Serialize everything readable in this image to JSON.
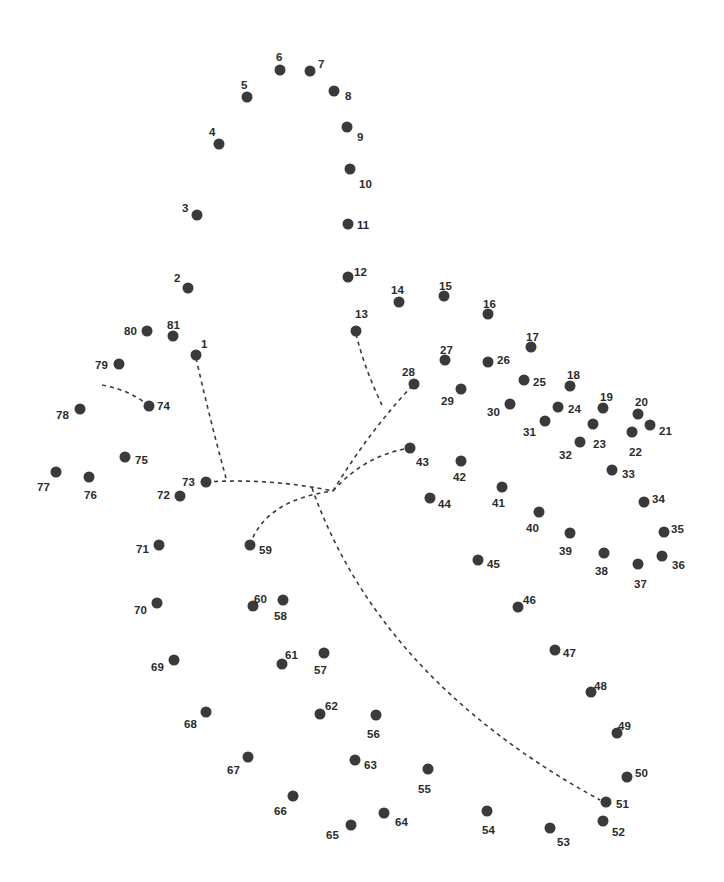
{
  "puzzle": {
    "type": "connect-the-dots",
    "dot_color": "#3a3a3a",
    "label_color": "#2b2b2b",
    "background": "#ffffff",
    "dots": [
      {
        "n": "1",
        "x": 196,
        "y": 355,
        "lx": 201,
        "ly": 344
      },
      {
        "n": "2",
        "x": 188,
        "y": 288,
        "lx": 174,
        "ly": 278
      },
      {
        "n": "3",
        "x": 197,
        "y": 215,
        "lx": 182,
        "ly": 208
      },
      {
        "n": "4",
        "x": 219,
        "y": 144,
        "lx": 209,
        "ly": 132
      },
      {
        "n": "5",
        "x": 247,
        "y": 97,
        "lx": 241,
        "ly": 85
      },
      {
        "n": "6",
        "x": 280,
        "y": 70,
        "lx": 276,
        "ly": 57
      },
      {
        "n": "7",
        "x": 310,
        "y": 71,
        "lx": 318,
        "ly": 64
      },
      {
        "n": "8",
        "x": 334,
        "y": 91,
        "lx": 345,
        "ly": 96
      },
      {
        "n": "9",
        "x": 347,
        "y": 127,
        "lx": 357,
        "ly": 137
      },
      {
        "n": "10",
        "x": 350,
        "y": 169,
        "lx": 359,
        "ly": 184
      },
      {
        "n": "11",
        "x": 348,
        "y": 224,
        "lx": 357,
        "ly": 225
      },
      {
        "n": "12",
        "x": 348,
        "y": 277,
        "lx": 354,
        "ly": 272
      },
      {
        "n": "13",
        "x": 356,
        "y": 331,
        "lx": 355,
        "ly": 314
      },
      {
        "n": "14",
        "x": 399,
        "y": 302,
        "lx": 391,
        "ly": 290
      },
      {
        "n": "15",
        "x": 444,
        "y": 296,
        "lx": 439,
        "ly": 286
      },
      {
        "n": "16",
        "x": 488,
        "y": 314,
        "lx": 483,
        "ly": 304
      },
      {
        "n": "17",
        "x": 531,
        "y": 347,
        "lx": 526,
        "ly": 337
      },
      {
        "n": "18",
        "x": 570,
        "y": 386,
        "lx": 567,
        "ly": 375
      },
      {
        "n": "19",
        "x": 603,
        "y": 408,
        "lx": 600,
        "ly": 397
      },
      {
        "n": "20",
        "x": 638,
        "y": 414,
        "lx": 635,
        "ly": 402
      },
      {
        "n": "21",
        "x": 650,
        "y": 425,
        "lx": 659,
        "ly": 431
      },
      {
        "n": "22",
        "x": 632,
        "y": 432,
        "lx": 629,
        "ly": 452
      },
      {
        "n": "23",
        "x": 593,
        "y": 424,
        "lx": 593,
        "ly": 444
      },
      {
        "n": "24",
        "x": 558,
        "y": 407,
        "lx": 568,
        "ly": 409
      },
      {
        "n": "25",
        "x": 524,
        "y": 380,
        "lx": 533,
        "ly": 382
      },
      {
        "n": "26",
        "x": 488,
        "y": 362,
        "lx": 497,
        "ly": 360
      },
      {
        "n": "27",
        "x": 445,
        "y": 360,
        "lx": 440,
        "ly": 350
      },
      {
        "n": "28",
        "x": 414,
        "y": 384,
        "lx": 402,
        "ly": 372
      },
      {
        "n": "29",
        "x": 461,
        "y": 389,
        "lx": 441,
        "ly": 401
      },
      {
        "n": "30",
        "x": 510,
        "y": 404,
        "lx": 487,
        "ly": 412
      },
      {
        "n": "31",
        "x": 545,
        "y": 421,
        "lx": 523,
        "ly": 432
      },
      {
        "n": "32",
        "x": 580,
        "y": 442,
        "lx": 559,
        "ly": 455
      },
      {
        "n": "33",
        "x": 612,
        "y": 470,
        "lx": 622,
        "ly": 474
      },
      {
        "n": "34",
        "x": 644,
        "y": 502,
        "lx": 652,
        "ly": 499
      },
      {
        "n": "35",
        "x": 664,
        "y": 532,
        "lx": 671,
        "ly": 529
      },
      {
        "n": "36",
        "x": 662,
        "y": 556,
        "lx": 672,
        "ly": 565
      },
      {
        "n": "37",
        "x": 638,
        "y": 564,
        "lx": 634,
        "ly": 584
      },
      {
        "n": "38",
        "x": 604,
        "y": 553,
        "lx": 595,
        "ly": 571
      },
      {
        "n": "39",
        "x": 570,
        "y": 533,
        "lx": 559,
        "ly": 551
      },
      {
        "n": "40",
        "x": 539,
        "y": 512,
        "lx": 526,
        "ly": 528
      },
      {
        "n": "41",
        "x": 502,
        "y": 487,
        "lx": 492,
        "ly": 503
      },
      {
        "n": "42",
        "x": 461,
        "y": 461,
        "lx": 453,
        "ly": 477
      },
      {
        "n": "43",
        "x": 410,
        "y": 448,
        "lx": 416,
        "ly": 462
      },
      {
        "n": "44",
        "x": 430,
        "y": 498,
        "lx": 438,
        "ly": 504
      },
      {
        "n": "45",
        "x": 478,
        "y": 560,
        "lx": 487,
        "ly": 564
      },
      {
        "n": "46",
        "x": 518,
        "y": 607,
        "lx": 523,
        "ly": 600
      },
      {
        "n": "47",
        "x": 555,
        "y": 650,
        "lx": 563,
        "ly": 653
      },
      {
        "n": "48",
        "x": 591,
        "y": 692,
        "lx": 594,
        "ly": 686
      },
      {
        "n": "49",
        "x": 617,
        "y": 733,
        "lx": 618,
        "ly": 726
      },
      {
        "n": "50",
        "x": 627,
        "y": 777,
        "lx": 635,
        "ly": 773
      },
      {
        "n": "51",
        "x": 606,
        "y": 802,
        "lx": 616,
        "ly": 804
      },
      {
        "n": "52",
        "x": 603,
        "y": 821,
        "lx": 612,
        "ly": 832
      },
      {
        "n": "53",
        "x": 550,
        "y": 828,
        "lx": 557,
        "ly": 842
      },
      {
        "n": "54",
        "x": 487,
        "y": 811,
        "lx": 482,
        "ly": 830
      },
      {
        "n": "55",
        "x": 428,
        "y": 769,
        "lx": 418,
        "ly": 789
      },
      {
        "n": "56",
        "x": 376,
        "y": 715,
        "lx": 367,
        "ly": 734
      },
      {
        "n": "57",
        "x": 324,
        "y": 653,
        "lx": 314,
        "ly": 670
      },
      {
        "n": "58",
        "x": 283,
        "y": 600,
        "lx": 274,
        "ly": 616
      },
      {
        "n": "59",
        "x": 250,
        "y": 545,
        "lx": 259,
        "ly": 550
      },
      {
        "n": "60",
        "x": 253,
        "y": 606,
        "lx": 254,
        "ly": 599
      },
      {
        "n": "61",
        "x": 282,
        "y": 664,
        "lx": 285,
        "ly": 655
      },
      {
        "n": "62",
        "x": 320,
        "y": 714,
        "lx": 325,
        "ly": 706
      },
      {
        "n": "63",
        "x": 355,
        "y": 760,
        "lx": 364,
        "ly": 765
      },
      {
        "n": "64",
        "x": 384,
        "y": 813,
        "lx": 395,
        "ly": 822
      },
      {
        "n": "65",
        "x": 351,
        "y": 825,
        "lx": 326,
        "ly": 835
      },
      {
        "n": "66",
        "x": 293,
        "y": 796,
        "lx": 274,
        "ly": 811
      },
      {
        "n": "67",
        "x": 248,
        "y": 757,
        "lx": 227,
        "ly": 770
      },
      {
        "n": "68",
        "x": 206,
        "y": 712,
        "lx": 184,
        "ly": 724
      },
      {
        "n": "69",
        "x": 174,
        "y": 660,
        "lx": 151,
        "ly": 667
      },
      {
        "n": "70",
        "x": 157,
        "y": 603,
        "lx": 134,
        "ly": 610
      },
      {
        "n": "71",
        "x": 159,
        "y": 545,
        "lx": 136,
        "ly": 549
      },
      {
        "n": "72",
        "x": 180,
        "y": 496,
        "lx": 157,
        "ly": 495
      },
      {
        "n": "73",
        "x": 206,
        "y": 482,
        "lx": 182,
        "ly": 482
      },
      {
        "n": "74",
        "x": 149,
        "y": 406,
        "lx": 157,
        "ly": 406
      },
      {
        "n": "75",
        "x": 125,
        "y": 457,
        "lx": 135,
        "ly": 460
      },
      {
        "n": "76",
        "x": 89,
        "y": 477,
        "lx": 84,
        "ly": 495
      },
      {
        "n": "77",
        "x": 56,
        "y": 472,
        "lx": 37,
        "ly": 487
      },
      {
        "n": "78",
        "x": 80,
        "y": 409,
        "lx": 56,
        "ly": 415
      },
      {
        "n": "79",
        "x": 119,
        "y": 364,
        "lx": 95,
        "ly": 365
      },
      {
        "n": "80",
        "x": 147,
        "y": 331,
        "lx": 124,
        "ly": 331
      },
      {
        "n": "81",
        "x": 173,
        "y": 336,
        "lx": 167,
        "ly": 325
      }
    ],
    "guides": [
      "M196,358 Q210,420 226,478",
      "M206,482 Q270,478 333,491",
      "M333,491 Q370,430 414,384",
      "M356,334 Q365,370 382,405",
      "M333,491 Q365,455 410,448",
      "M250,545 Q265,500 333,491",
      "M312,488 Q380,680 600,800",
      "M102,385 Q130,390 149,406"
    ]
  }
}
